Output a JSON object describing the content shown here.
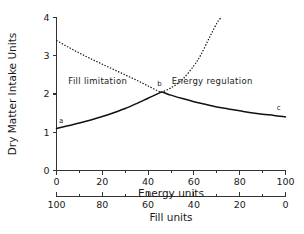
{
  "chart_data": {
    "type": "line",
    "title": "",
    "ylabel": "Dry Matter Intake Units",
    "xlabel": "Energy units",
    "xlabel_secondary": "Fill units",
    "ylim": [
      0,
      4
    ],
    "xlim": [
      0,
      100
    ],
    "xlim_secondary": [
      100,
      0
    ],
    "grid": false,
    "legend": "none",
    "y_ticks": [
      "0",
      "1",
      "2",
      "3",
      "4"
    ],
    "y_tick_values": [
      0,
      1,
      2,
      3,
      4
    ],
    "x_ticks": [
      "0",
      "20",
      "40",
      "60",
      "80",
      "100"
    ],
    "x_tick_values": [
      0,
      20,
      40,
      60,
      80,
      100
    ],
    "x_ticks_secondary": [
      "100",
      "80",
      "60",
      "40",
      "20",
      "0"
    ],
    "x_tick_values_secondary": [
      100,
      80,
      60,
      40,
      20,
      0
    ],
    "series": [
      {
        "name": "Fill limitation curve",
        "style": "dotted",
        "x": [
          0,
          5,
          10,
          15,
          20,
          25,
          30,
          35,
          40,
          45,
          46,
          50,
          55,
          60,
          63,
          66,
          68,
          70,
          71,
          72
        ],
        "values": [
          3.4,
          3.23,
          3.07,
          2.92,
          2.78,
          2.64,
          2.5,
          2.36,
          2.21,
          2.06,
          2.05,
          2.16,
          2.38,
          2.74,
          3.02,
          3.38,
          3.62,
          3.85,
          3.94,
          4.0
        ]
      },
      {
        "name": "Energy regulation curve",
        "style": "solid",
        "x": [
          0,
          5,
          10,
          15,
          20,
          25,
          30,
          35,
          40,
          45,
          46,
          50,
          55,
          60,
          65,
          70,
          75,
          80,
          85,
          90,
          95,
          100
        ],
        "values": [
          1.1,
          1.17,
          1.24,
          1.32,
          1.41,
          1.51,
          1.62,
          1.75,
          1.89,
          2.03,
          2.05,
          1.97,
          1.88,
          1.8,
          1.73,
          1.66,
          1.61,
          1.56,
          1.51,
          1.47,
          1.44,
          1.4
        ]
      }
    ],
    "annotations": [
      {
        "text": "Fill limitation",
        "x": 18,
        "y": 2.25
      },
      {
        "text": "Energy regulation",
        "x": 68,
        "y": 2.25
      }
    ],
    "point_labels": [
      {
        "label": "a",
        "x": 2,
        "y": 1.24
      },
      {
        "label": "b",
        "x": 45,
        "y": 2.2
      },
      {
        "label": "c",
        "x": 97,
        "y": 1.58
      }
    ],
    "colors": {
      "curve": "#111111",
      "axis": "#333333",
      "text": "#1a1a1a",
      "background": "#ffffff"
    }
  },
  "labels": {
    "y_axis_title": "Dry Matter Intake Units",
    "x_axis_title": "Energy units",
    "x_axis_title_secondary": "Fill units",
    "region_left": "Fill limitation",
    "region_right": "Energy regulation",
    "point_a": "a",
    "point_b": "b",
    "point_c": "c"
  },
  "y_tick_labels": [
    "0",
    "1",
    "2",
    "3",
    "4"
  ],
  "x_tick_labels": [
    "0",
    "20",
    "40",
    "60",
    "80",
    "100"
  ],
  "x_tick_labels_secondary": [
    "100",
    "80",
    "60",
    "40",
    "20",
    "0"
  ]
}
